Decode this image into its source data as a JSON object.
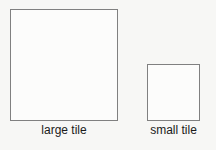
{
  "figure": {
    "background_color": "#f7f7f5",
    "stroke_color": "#808080",
    "fill_color": "#fcfcfb",
    "text_color": "#1a1a1a"
  },
  "chart_data": {
    "type": "diagram",
    "title": "",
    "subtitle": "",
    "xlabel": "",
    "ylabel": "",
    "grid": false,
    "legend": "none",
    "shapes": [
      {
        "name": "large tile",
        "shape": "square",
        "label": "large tile",
        "x": 10,
        "y": 9,
        "width": 108,
        "height": 112,
        "fill": "#fcfcfb",
        "stroke": "#808080",
        "stroke_width": 1
      },
      {
        "name": "small tile",
        "shape": "square",
        "label": "small tile",
        "x": 147,
        "y": 64,
        "width": 53,
        "height": 57,
        "fill": "#fcfcfb",
        "stroke": "#808080",
        "stroke_width": 1
      }
    ]
  },
  "tiles": [
    {
      "label": "large tile"
    },
    {
      "label": "small tile"
    }
  ]
}
